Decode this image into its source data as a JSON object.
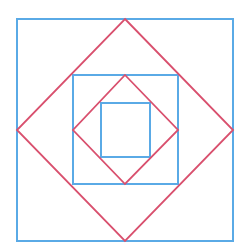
{
  "diagram": {
    "colors": {
      "square": "#5aaae6",
      "diamond": "#d9506e",
      "background": "#ffffff"
    },
    "squares": [
      {
        "name": "outer-square",
        "x": 17,
        "y": 19,
        "w": 216,
        "h": 222
      },
      {
        "name": "middle-square",
        "x": 73,
        "y": 75,
        "w": 105,
        "h": 109
      },
      {
        "name": "inner-square",
        "x": 101,
        "y": 103,
        "w": 49,
        "h": 54
      }
    ],
    "diamonds": [
      {
        "name": "outer-diamond",
        "points": "125,19 233,130 125,241 17,130"
      },
      {
        "name": "inner-diamond",
        "points": "125,75 178,130 125,184 73,130"
      }
    ]
  }
}
